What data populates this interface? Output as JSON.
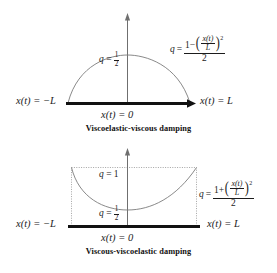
{
  "figure": {
    "background_color": "#ffffff",
    "ink_color": "#1b1b1b",
    "baseline_color": "#111111"
  },
  "panels": [
    {
      "id": "viscoelastic-viscous",
      "caption": "Viscoelastic-viscous  damping",
      "curve_shape": "downward-opening parabola (dome)",
      "labels": {
        "peak_q": {
          "lhs": "q",
          "eq": "=",
          "num": "1",
          "den": "2"
        },
        "left_axis": "x(t) = −L",
        "center_axis": "x(t) = 0",
        "right_axis": "x(t) = L"
      },
      "formula": {
        "lhs": "q",
        "eq": "=",
        "num_lead": "1",
        "num_sign": "−",
        "inner_num": "x(t)",
        "inner_den": "L",
        "exponent": "2",
        "den": "2"
      },
      "chart_values": {
        "q_at_center": 0.5,
        "q_at_minus_L": 0,
        "q_at_plus_L": 0
      }
    },
    {
      "id": "viscous-viscoelastic",
      "caption": "Viscous-viscoelastic  damping",
      "curve_shape": "upward-opening parabola (valley)",
      "labels": {
        "top_q": {
          "lhs": "q",
          "eq": "=",
          "value": "1"
        },
        "min_q": {
          "lhs": "q",
          "eq": "=",
          "num": "1",
          "den": "2"
        },
        "left_axis": "x(t) = −L",
        "center_axis": "x(t) = 0",
        "right_axis": "x(t) = L"
      },
      "formula": {
        "lhs": "q",
        "eq": "=",
        "num_lead": "1",
        "num_sign": "+",
        "inner_num": "x(t)",
        "inner_den": "L",
        "exponent": "2",
        "den": "2"
      },
      "chart_values": {
        "q_at_center": 0.5,
        "q_at_minus_L": 1,
        "q_at_plus_L": 1
      }
    }
  ]
}
